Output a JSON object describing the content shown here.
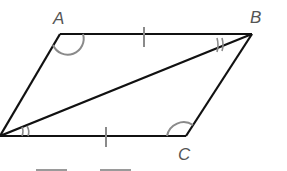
{
  "diagram": {
    "type": "parallelogram-with-diagonal",
    "vertices": {
      "A": {
        "label": "A",
        "x": 60,
        "y": 34
      },
      "B": {
        "label": "B",
        "x": 252,
        "y": 34
      },
      "C": {
        "label": "C",
        "x": 186,
        "y": 136
      },
      "D": {
        "label": "",
        "x": 0,
        "y": 136
      }
    },
    "labels": {
      "A": "A",
      "B": "B",
      "C": "C"
    },
    "diagonal": "DB",
    "marks": {
      "congruent_sides": [
        "AB",
        "DC"
      ],
      "congruent_angles_single_arc": [
        "A",
        "C"
      ],
      "congruent_angles_double_mark": [
        "ABD",
        "BDC"
      ]
    },
    "colors": {
      "lines": "#111111",
      "marks": "#8a8a8a",
      "labels": "#555555"
    },
    "blanks": [
      "",
      ""
    ]
  }
}
